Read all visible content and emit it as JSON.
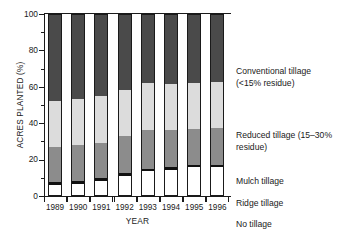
{
  "chart_data": {
    "type": "bar",
    "subtype": "stacked-bar-100pct",
    "title": "",
    "xlabel": "YEAR",
    "ylabel": "ACRES PLANTED (%)",
    "ylim": [
      0,
      100
    ],
    "yticks": [
      0,
      20,
      40,
      60,
      80,
      100
    ],
    "yminorticks": [
      10,
      30,
      50,
      70,
      90
    ],
    "grid": false,
    "legend_position": "right",
    "categories": [
      "1989",
      "1990",
      "1991",
      "1992",
      "1993",
      "1994",
      "1995",
      "1996"
    ],
    "series": [
      {
        "name": "No tillage",
        "key": "notill",
        "color": "#ffffff",
        "values": [
          6,
          6.5,
          8.5,
          11,
          13.5,
          14.5,
          16,
          16
        ]
      },
      {
        "name": "Ridge tillage",
        "key": "ridge",
        "color": "#111111",
        "values": [
          1.5,
          1.5,
          1.5,
          1.5,
          1.5,
          1.5,
          1,
          1
        ]
      },
      {
        "name": "Mulch tillage",
        "key": "mulch",
        "color": "#8c8c8c",
        "values": [
          19.5,
          20,
          19,
          20.5,
          21,
          20.5,
          20,
          20.5
        ]
      },
      {
        "name": "Reduced tillage (15–30% residue)",
        "key": "reduced",
        "color": "#dcdcdc",
        "values": [
          25,
          25.5,
          26,
          25.5,
          26,
          25,
          25,
          25
        ]
      },
      {
        "name": "Conventional tillage (<15% residue)",
        "key": "conventional",
        "color": "#4a4a4a",
        "values": [
          48,
          46.5,
          45,
          41.5,
          38,
          38.5,
          38,
          37.5
        ]
      }
    ],
    "cumulative_tops": {
      "1989": {
        "notill": 6,
        "ridge": 7.5,
        "mulch": 27,
        "reduced": 52,
        "conventional": 100
      },
      "1990": {
        "notill": 6.5,
        "ridge": 8,
        "mulch": 28,
        "reduced": 53.5,
        "conventional": 100
      },
      "1991": {
        "notill": 8.5,
        "ridge": 10,
        "mulch": 29,
        "reduced": 55,
        "conventional": 100
      },
      "1992": {
        "notill": 11,
        "ridge": 12.5,
        "mulch": 33,
        "reduced": 58.5,
        "conventional": 100
      },
      "1993": {
        "notill": 13.5,
        "ridge": 15,
        "mulch": 36,
        "reduced": 62,
        "conventional": 100
      },
      "1994": {
        "notill": 14.5,
        "ridge": 16,
        "mulch": 36.5,
        "reduced": 61.5,
        "conventional": 100
      },
      "1995": {
        "notill": 16,
        "ridge": 17,
        "mulch": 37,
        "reduced": 62,
        "conventional": 100
      },
      "1996": {
        "notill": 16,
        "ridge": 17,
        "mulch": 37.5,
        "reduced": 62.5,
        "conventional": 100
      }
    }
  },
  "axes": {
    "ylabel": "ACRES PLANTED (%)",
    "xlabel": "YEAR",
    "ytick_labels": [
      "0",
      "20",
      "40",
      "60",
      "80",
      "100"
    ],
    "xtick_labels": [
      "1989",
      "1990",
      "1991",
      "1992",
      "1993",
      "1994",
      "1995",
      "1996"
    ]
  },
  "legend": {
    "entries": [
      {
        "label": "Conventional tillage (<15% residue)",
        "key": "conventional"
      },
      {
        "label": "Reduced tillage (15–30% residue)",
        "key": "reduced"
      },
      {
        "label": "Mulch tillage",
        "key": "mulch"
      },
      {
        "label": "Ridge tillage",
        "key": "ridge"
      },
      {
        "label": "No tillage",
        "key": "notill"
      }
    ]
  },
  "colors": {
    "conventional": "#4a4a4a",
    "reduced": "#dcdcdc",
    "mulch": "#8c8c8c",
    "ridge": "#111111",
    "notill": "#ffffff",
    "axis": "#1a1a1a",
    "background": "#ffffff"
  }
}
